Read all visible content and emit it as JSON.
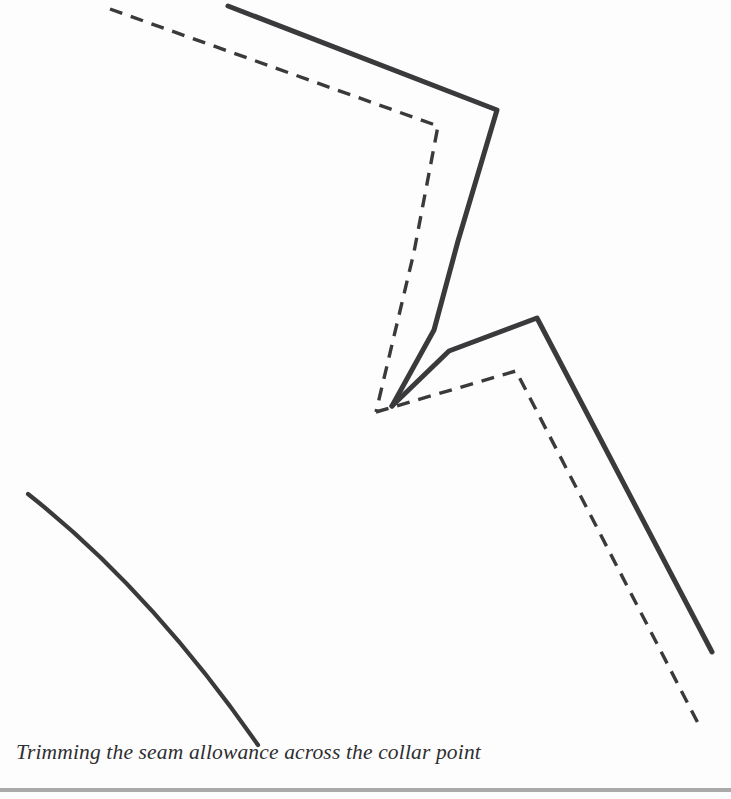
{
  "page": {
    "width": 731,
    "height": 799,
    "background_color": "#fdfdfd",
    "caption": "Trimming the seam allowance across the collar point",
    "caption_style": "italic-serif",
    "caption_color": "#2e2e30",
    "rule_color": "#9b9b9b"
  },
  "figure": {
    "title": "Trimming the seam allowance across the collar point",
    "type": "line-diagram",
    "stroke_color": "#3a3a3c",
    "dash_color": "#3a3a3c",
    "solid_stroke_width": 5,
    "dashed_stroke_width": 3.4,
    "dash_pattern": "13 9",
    "paths": {
      "solid_upper_edge": "M 228 6 L 497 110 L 458 241 L 434 330 L 392 406",
      "solid_lower_edge": "M 392 406 L 449 351 L 537 318 L 712 652",
      "dashed_upper_seam": "M 110 9 L 438 126 L 414 252 L 376 412",
      "dashed_lower_seam": "M 376 412 L 516 371 L 700 727",
      "curved_edge": "M 28 494 Q 150 590 258 745"
    }
  }
}
